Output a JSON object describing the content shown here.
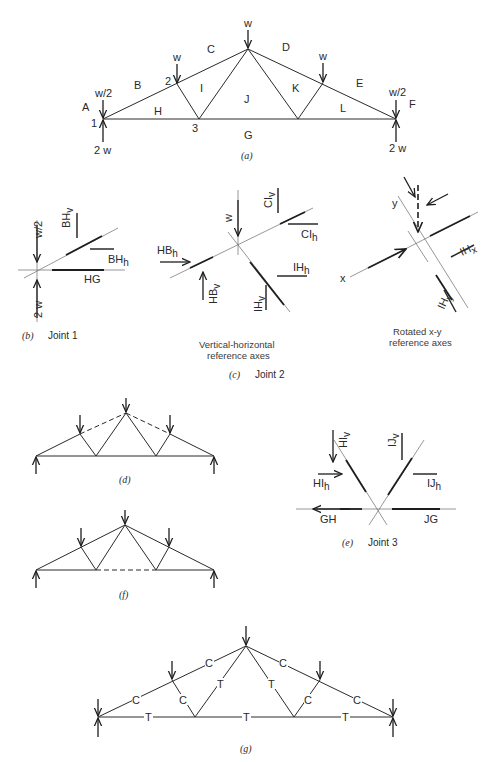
{
  "figure_a": {
    "caption": "(a)",
    "region_labels": [
      "A",
      "B",
      "C",
      "D",
      "E",
      "F",
      "G",
      "H",
      "I",
      "J",
      "K",
      "L"
    ],
    "joint_labels": [
      "1",
      "2",
      "3"
    ],
    "loads": {
      "apex": "w",
      "node2": "w",
      "node_right": "w",
      "left_support": "w/2",
      "right_support": "w/2"
    },
    "reactions": {
      "left": "2 w",
      "right": "2 w"
    }
  },
  "figure_b": {
    "caption_letter": "(b)",
    "caption_text": "Joint 1",
    "labels": {
      "load": "w/2",
      "reaction": "2 w",
      "bhv": "BH",
      "bhv_sub": "v",
      "bhh": "BH",
      "bhh_sub": "h",
      "hg": "HG"
    }
  },
  "figure_c": {
    "caption_letter": "(c)",
    "caption_text": "Joint 2",
    "left_title_line1": "Vertical-horizontal",
    "left_title_line2": "reference axes",
    "right_title_line1": "Rotated x-y",
    "right_title_line2": "reference axes",
    "labels": {
      "load": "w",
      "hbh": "HB",
      "hbh_sub": "h",
      "hbv": "HB",
      "hbv_sub": "v",
      "clv": "CI",
      "clv_sub": "v",
      "clh": "CI",
      "clh_sub": "h",
      "ihh": "IH",
      "ihh_sub": "h",
      "ihv": "IH",
      "ihv_sub": "v",
      "x_axis": "x",
      "y_axis": "y",
      "ihx": "IH",
      "ihx_sub": "x",
      "ihy": "IH",
      "ihy_sub": "y"
    }
  },
  "figure_d": {
    "caption": "(d)"
  },
  "figure_e": {
    "caption_letter": "(e)",
    "caption_text": "Joint 3",
    "labels": {
      "hiv": "HI",
      "hiv_sub": "v",
      "ijv": "IJ",
      "ijv_sub": "v",
      "hih": "HI",
      "hih_sub": "h",
      "ijh": "IJ",
      "ijh_sub": "h",
      "gh": "GH",
      "jg": "JG"
    }
  },
  "figure_f": {
    "caption": "(f)"
  },
  "figure_g": {
    "caption": "(g)",
    "member_forces": {
      "top_left_outer": "C",
      "top_left_inner": "C",
      "top_right_inner": "C",
      "top_right_outer": "C",
      "web_left_short": "C",
      "web_left_long": "T",
      "web_right_long": "T",
      "web_right_short": "C",
      "bottom_left": "T",
      "bottom_mid": "T",
      "bottom_right": "T"
    }
  }
}
